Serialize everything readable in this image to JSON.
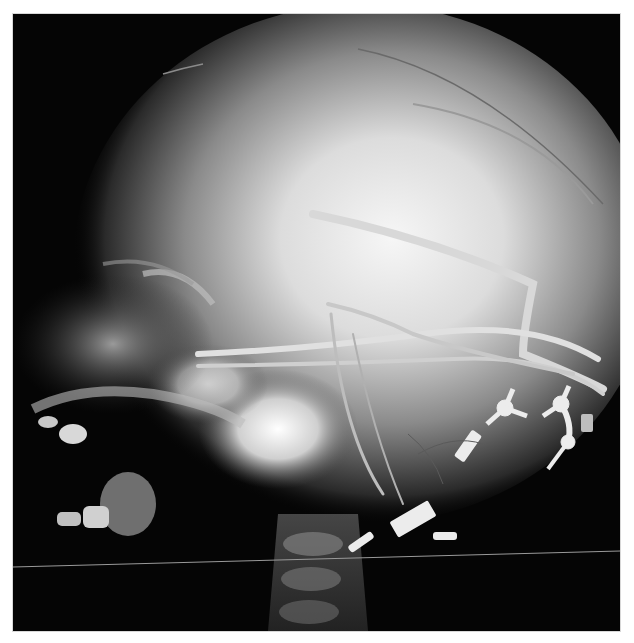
{
  "image": {
    "kind": "radiograph",
    "view": "lateral skull",
    "background_color": "#ffffff",
    "film_color": "#050505",
    "glow_color": "#f4f4f4",
    "hardware_color": "#e8e8e8",
    "visible_text": []
  },
  "structures": [
    {
      "id": "cranial-vault",
      "label": "cranial vault"
    },
    {
      "id": "shunt-tubing",
      "label": "shunt tubing"
    },
    {
      "id": "fixation-hardware",
      "label": "fixation hardware"
    },
    {
      "id": "facial-bones",
      "label": "facial bones and teeth"
    },
    {
      "id": "cervical-spine",
      "label": "cervical spine"
    },
    {
      "id": "scan-line",
      "label": "horizontal scan artifact"
    }
  ]
}
